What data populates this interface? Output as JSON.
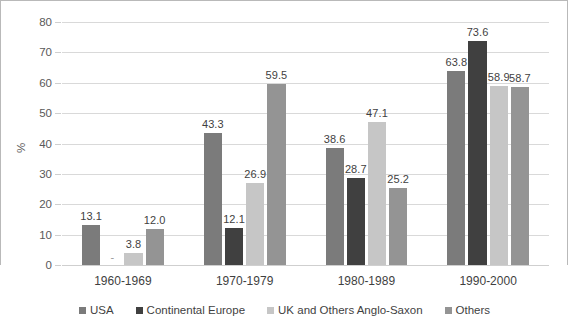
{
  "chart_data": {
    "type": "bar",
    "title": "",
    "subtitle": "",
    "xlabel": "",
    "ylabel": "%",
    "ylim": [
      0,
      80
    ],
    "ytick_step": 10,
    "yticks": [
      0,
      10,
      20,
      30,
      40,
      50,
      60,
      70,
      80
    ],
    "ytick_labels": [
      "0",
      "10",
      "20",
      "30",
      "40",
      "50",
      "60",
      "70",
      "80"
    ],
    "grid": true,
    "grid_axis": "y",
    "legend_position": "bottom",
    "categories": [
      "1960-1969",
      "1970-1979",
      "1980-1989",
      "1990-2000"
    ],
    "series": [
      {
        "name": "USA",
        "color": "#7b7b7b",
        "values": [
          13.1,
          43.3,
          38.6,
          63.8
        ],
        "labels": [
          "13.1",
          "43.3",
          "38.6",
          "63.8"
        ]
      },
      {
        "name": "Continental Europe",
        "color": "#404040",
        "values": [
          null,
          12.1,
          28.7,
          73.6
        ],
        "labels": [
          "-",
          "12.1",
          "28.7",
          "73.6"
        ]
      },
      {
        "name": "UK and Others Anglo-Saxon",
        "color": "#c6c6c6",
        "values": [
          3.8,
          26.9,
          47.1,
          58.9
        ],
        "labels": [
          "3.8",
          "26.9",
          "47.1",
          "58.9"
        ]
      },
      {
        "name": "Others",
        "color": "#949494",
        "values": [
          12.0,
          59.5,
          25.2,
          58.7
        ],
        "labels": [
          "12.0",
          "59.5",
          "25.2",
          "58.7"
        ]
      }
    ]
  },
  "style": {
    "background": "#ffffff",
    "gridline_color": "#d9d9d9",
    "axis_color": "#cfcfcf",
    "frame_color": "#b9b9b9",
    "tick_text_color": "#595959",
    "label_text_color": "#3f3f3f"
  }
}
